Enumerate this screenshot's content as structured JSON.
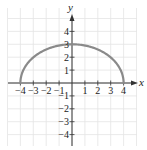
{
  "chart_data": {
    "type": "line",
    "title": "",
    "xlabel": "x",
    "ylabel": "y",
    "xlim": [
      -4.5,
      5
    ],
    "ylim": [
      -5,
      5
    ],
    "grid": true,
    "x_ticks": [
      -4,
      -3,
      -2,
      -1,
      1,
      2,
      3,
      4
    ],
    "y_ticks": [
      -4,
      -3,
      -2,
      -1,
      1,
      2,
      3,
      4
    ],
    "x_tick_labels": [
      "−4",
      "−3",
      "−2",
      "−1",
      "1",
      "2",
      "3",
      "4"
    ],
    "y_tick_labels": [
      "−4",
      "−3",
      "−2",
      "−1",
      "1",
      "2",
      "3",
      "4"
    ],
    "series": [
      {
        "name": "upper half-ellipse y = 3·sqrt(1 − x²/16)",
        "color": "#8a8a8a",
        "x": [
          -4,
          -3,
          -2,
          -1,
          0,
          1,
          2,
          3,
          4
        ],
        "y": [
          0,
          1.98,
          2.6,
          2.9,
          3,
          2.9,
          2.6,
          1.98,
          0
        ]
      }
    ],
    "curve": {
      "a": 4,
      "b": 3,
      "center": [
        0,
        0
      ],
      "half": "upper"
    }
  },
  "colors": {
    "grid": "#e4e4e4",
    "axis": "#333333",
    "curve": "#8a8a8a"
  }
}
